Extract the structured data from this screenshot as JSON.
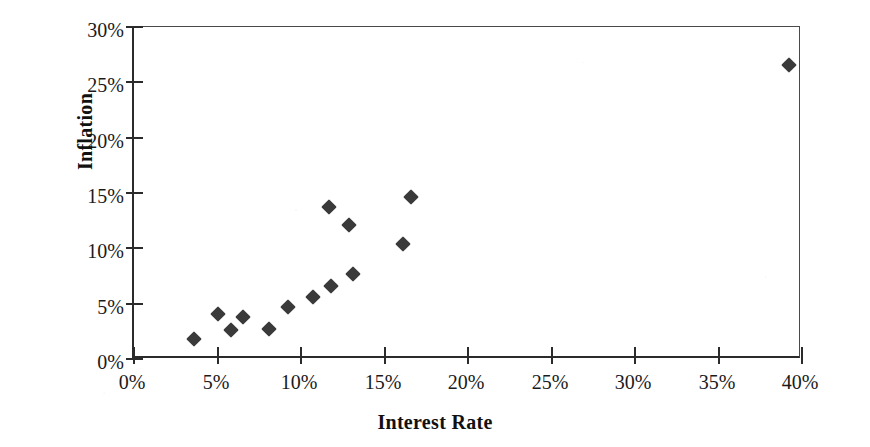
{
  "chart_data": {
    "type": "scatter",
    "title": "",
    "xlabel": "Interest Rate",
    "ylabel": "Inflation",
    "xlim": [
      0,
      40
    ],
    "ylim": [
      0,
      30
    ],
    "xtick_labels": [
      "0%",
      "5%",
      "10%",
      "15%",
      "20%",
      "25%",
      "30%",
      "35%",
      "40%"
    ],
    "xtick_values": [
      0,
      5,
      10,
      15,
      20,
      25,
      30,
      35,
      40
    ],
    "ytick_labels": [
      "0%",
      "5%",
      "10%",
      "15%",
      "20%",
      "25%",
      "30%"
    ],
    "ytick_values": [
      0,
      5,
      10,
      15,
      20,
      25,
      30
    ],
    "grid": false,
    "legend": false,
    "marker": "diamond",
    "marker_color": "#3a3a3a",
    "series": [
      {
        "name": "Countries",
        "points": [
          {
            "x": 3.6,
            "y": 1.8
          },
          {
            "x": 5.0,
            "y": 4.1
          },
          {
            "x": 5.8,
            "y": 2.6
          },
          {
            "x": 6.5,
            "y": 3.8
          },
          {
            "x": 8.1,
            "y": 2.7
          },
          {
            "x": 9.2,
            "y": 4.7
          },
          {
            "x": 10.7,
            "y": 5.6
          },
          {
            "x": 11.8,
            "y": 6.6
          },
          {
            "x": 11.7,
            "y": 13.7
          },
          {
            "x": 12.9,
            "y": 12.1
          },
          {
            "x": 13.1,
            "y": 7.7
          },
          {
            "x": 16.1,
            "y": 10.4
          },
          {
            "x": 16.6,
            "y": 14.6
          },
          {
            "x": 39.2,
            "y": 26.6
          }
        ]
      }
    ]
  },
  "axis": {
    "x_title": "Interest Rate",
    "y_title": "Inflation"
  }
}
